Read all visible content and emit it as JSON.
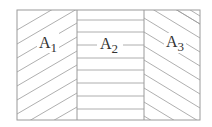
{
  "diagram": {
    "type": "hatched-regions",
    "regions": [
      {
        "id": "A1",
        "label": "A",
        "subscript": "1",
        "hatch": "diagonal-up-right"
      },
      {
        "id": "A2",
        "label": "A",
        "subscript": "2",
        "hatch": "horizontal"
      },
      {
        "id": "A3",
        "label": "A",
        "subscript": "3",
        "hatch": "diagonal-down-right"
      }
    ],
    "colors": {
      "line": "#999999",
      "text": "#333333",
      "background": "#ffffff"
    }
  }
}
